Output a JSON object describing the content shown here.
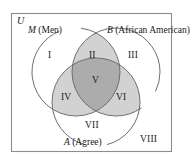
{
  "figure": {
    "type": "venn-diagram-3-set",
    "universe": {
      "symbol": "U",
      "border_color": "#8d8d8d",
      "background": "#ffffff"
    },
    "sets": [
      {
        "id": "M",
        "symbol": "M",
        "name": "(Men)",
        "position": "top-left"
      },
      {
        "id": "B",
        "symbol": "B",
        "name": "(African American)",
        "position": "top-right"
      },
      {
        "id": "A",
        "symbol": "A",
        "name": "(Agree)",
        "position": "bottom"
      }
    ],
    "regions": [
      {
        "label": "I",
        "desc": "M only",
        "shade": "none"
      },
      {
        "label": "II",
        "desc": "M and B only",
        "shade": "light"
      },
      {
        "label": "III",
        "desc": "B only",
        "shade": "none"
      },
      {
        "label": "IV",
        "desc": "M and A only",
        "shade": "light"
      },
      {
        "label": "V",
        "desc": "M and B and A",
        "shade": "dark"
      },
      {
        "label": "VI",
        "desc": "B and A only",
        "shade": "light"
      },
      {
        "label": "VII",
        "desc": "A only",
        "shade": "none"
      },
      {
        "label": "VIII",
        "desc": "outside all sets",
        "shade": "none"
      }
    ],
    "colors": {
      "shade_light": "#d2d2d2",
      "shade_dark": "#acacac",
      "circle_stroke": "#6e6e6e",
      "text": "#1a1a1a",
      "frame": "#8d8d8d"
    }
  }
}
